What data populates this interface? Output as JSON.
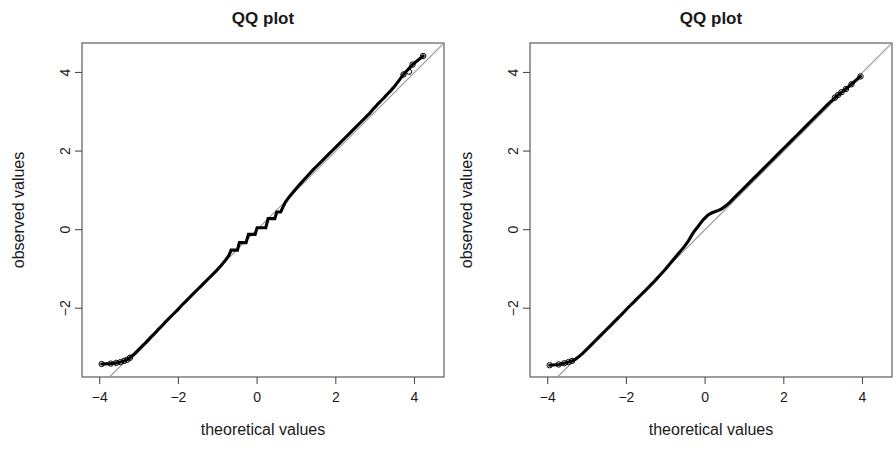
{
  "figure": {
    "width": 896,
    "height": 460,
    "background": "#ffffff",
    "panel_count": 2
  },
  "colors": {
    "point": "#000000",
    "reference_line": "#9a9a9a",
    "axis": "#4d4d4d",
    "text": "#1a1a1a",
    "background": "#ffffff"
  },
  "chart_data": [
    {
      "type": "scatter",
      "panel": "left",
      "title": "QQ plot",
      "xlabel": "theoretical values",
      "ylabel": "observed values",
      "xlim": [
        -4.45,
        4.75
      ],
      "ylim": [
        -3.75,
        4.75
      ],
      "xticks": [
        -4,
        -2,
        0,
        2,
        4
      ],
      "xticklabels": [
        "-4",
        "-2",
        "0",
        "2",
        "4"
      ],
      "yticks": [
        -2,
        0,
        2,
        4
      ],
      "yticklabels": [
        "-2",
        "0",
        "2",
        "4"
      ],
      "grid": false,
      "legend": null,
      "reference_line": {
        "slope": 1.0,
        "intercept": 0.0,
        "label": "identity line",
        "color": "#9a9a9a"
      },
      "notes": "Dense chain of points with a discrete staircase near the centre; upper tail points sit above the identity line.",
      "x": [
        -3.95,
        -3.72,
        -3.58,
        -3.47,
        -3.38,
        -3.3,
        -3.23,
        -3.17,
        -3.11,
        -3.06,
        -3.01,
        -2.96,
        -2.91,
        -2.86,
        -2.8,
        -2.72,
        -2.62,
        -2.52,
        -2.42,
        -2.32,
        -2.22,
        -2.12,
        -2.02,
        -1.92,
        -1.82,
        -1.72,
        -1.62,
        -1.52,
        -1.42,
        -1.32,
        -1.22,
        -1.12,
        -1.02,
        -0.92,
        -0.82,
        -0.72,
        -0.66,
        -0.6,
        -0.55,
        -0.5,
        -0.45,
        -0.4,
        -0.34,
        -0.28,
        -0.22,
        -0.16,
        -0.1,
        -0.05,
        0.0,
        0.05,
        0.1,
        0.16,
        0.22,
        0.28,
        0.34,
        0.4,
        0.45,
        0.5,
        0.55,
        0.6,
        0.66,
        0.72,
        0.82,
        0.92,
        1.02,
        1.12,
        1.22,
        1.32,
        1.42,
        1.52,
        1.62,
        1.72,
        1.82,
        1.92,
        2.02,
        2.12,
        2.22,
        2.32,
        2.42,
        2.52,
        2.62,
        2.72,
        2.8,
        2.86,
        2.91,
        2.96,
        3.01,
        3.06,
        3.11,
        3.17,
        3.23,
        3.3,
        3.38,
        3.47,
        3.58,
        3.72,
        3.95,
        4.22
      ],
      "y": [
        -3.42,
        -3.41,
        -3.39,
        -3.37,
        -3.34,
        -3.31,
        -3.26,
        -3.21,
        -3.16,
        -3.11,
        -3.06,
        -3.01,
        -2.96,
        -2.91,
        -2.85,
        -2.76,
        -2.66,
        -2.55,
        -2.45,
        -2.34,
        -2.24,
        -2.14,
        -2.04,
        -1.93,
        -1.83,
        -1.73,
        -1.63,
        -1.53,
        -1.43,
        -1.33,
        -1.23,
        -1.13,
        -1.03,
        -0.92,
        -0.8,
        -0.66,
        -0.52,
        -0.52,
        -0.52,
        -0.52,
        -0.33,
        -0.33,
        -0.33,
        -0.33,
        -0.12,
        -0.12,
        -0.12,
        -0.12,
        0.05,
        0.05,
        0.05,
        0.05,
        0.05,
        0.28,
        0.28,
        0.28,
        0.28,
        0.45,
        0.45,
        0.45,
        0.58,
        0.7,
        0.84,
        0.96,
        1.08,
        1.19,
        1.3,
        1.41,
        1.52,
        1.62,
        1.72,
        1.82,
        1.92,
        2.02,
        2.12,
        2.22,
        2.32,
        2.42,
        2.52,
        2.62,
        2.72,
        2.82,
        2.9,
        2.96,
        3.02,
        3.08,
        3.13,
        3.19,
        3.24,
        3.3,
        3.36,
        3.44,
        3.52,
        3.62,
        3.76,
        3.95,
        4.2,
        4.42
      ],
      "open_tail_points": {
        "lower": [
          [
            -3.95,
            -3.42
          ],
          [
            -3.72,
            -3.41
          ],
          [
            -3.58,
            -3.39
          ],
          [
            -3.47,
            -3.37
          ],
          [
            -3.38,
            -3.34
          ],
          [
            -3.3,
            -3.31
          ],
          [
            -3.23,
            -3.26
          ]
        ],
        "upper": [
          [
            3.72,
            3.95
          ],
          [
            3.95,
            4.2
          ],
          [
            3.86,
            4.02
          ],
          [
            4.22,
            4.42
          ]
        ]
      }
    },
    {
      "type": "scatter",
      "panel": "right",
      "title": "QQ plot",
      "xlabel": "theoretical values",
      "ylabel": "observed values",
      "xlim": [
        -4.45,
        4.75
      ],
      "ylim": [
        -3.75,
        4.75
      ],
      "xticks": [
        -4,
        -2,
        0,
        2,
        4
      ],
      "xticklabels": [
        "-4",
        "-2",
        "0",
        "2",
        "4"
      ],
      "yticks": [
        -2,
        0,
        2,
        4
      ],
      "yticklabels": [
        "-2",
        "0",
        "2",
        "4"
      ],
      "grid": false,
      "legend": null,
      "reference_line": {
        "slope": 1.0,
        "intercept": 0.0,
        "label": "identity line",
        "color": "#9a9a9a"
      },
      "notes": "Smoother chain of points with a single S-bend near the centre; tails track the identity line closely.",
      "x": [
        -3.95,
        -3.72,
        -3.58,
        -3.47,
        -3.38,
        -3.3,
        -3.23,
        -3.17,
        -3.11,
        -3.06,
        -3.01,
        -2.96,
        -2.91,
        -2.86,
        -2.8,
        -2.72,
        -2.62,
        -2.52,
        -2.42,
        -2.32,
        -2.22,
        -2.12,
        -2.02,
        -1.92,
        -1.82,
        -1.72,
        -1.62,
        -1.52,
        -1.42,
        -1.32,
        -1.22,
        -1.12,
        -1.02,
        -0.92,
        -0.82,
        -0.72,
        -0.62,
        -0.52,
        -0.42,
        -0.34,
        -0.26,
        -0.18,
        -0.12,
        -0.06,
        0.0,
        0.06,
        0.12,
        0.18,
        0.26,
        0.34,
        0.42,
        0.52,
        0.62,
        0.72,
        0.82,
        0.92,
        1.02,
        1.12,
        1.22,
        1.32,
        1.42,
        1.52,
        1.62,
        1.72,
        1.82,
        1.92,
        2.02,
        2.12,
        2.22,
        2.32,
        2.42,
        2.52,
        2.62,
        2.72,
        2.8,
        2.86,
        2.91,
        2.96,
        3.01,
        3.06,
        3.11,
        3.17,
        3.23,
        3.3,
        3.38,
        3.47,
        3.58,
        3.72,
        3.95
      ],
      "y": [
        -3.45,
        -3.43,
        -3.4,
        -3.37,
        -3.34,
        -3.3,
        -3.25,
        -3.2,
        -3.15,
        -3.1,
        -3.05,
        -3.0,
        -2.95,
        -2.9,
        -2.84,
        -2.76,
        -2.66,
        -2.56,
        -2.46,
        -2.36,
        -2.26,
        -2.16,
        -2.05,
        -1.95,
        -1.85,
        -1.75,
        -1.65,
        -1.55,
        -1.45,
        -1.35,
        -1.24,
        -1.13,
        -1.02,
        -0.9,
        -0.78,
        -0.66,
        -0.54,
        -0.42,
        -0.28,
        -0.14,
        -0.02,
        0.08,
        0.16,
        0.24,
        0.3,
        0.36,
        0.4,
        0.43,
        0.46,
        0.49,
        0.53,
        0.6,
        0.69,
        0.79,
        0.89,
        0.99,
        1.09,
        1.19,
        1.29,
        1.39,
        1.49,
        1.59,
        1.69,
        1.79,
        1.89,
        1.99,
        2.09,
        2.19,
        2.29,
        2.39,
        2.49,
        2.59,
        2.69,
        2.79,
        2.87,
        2.93,
        2.98,
        3.03,
        3.08,
        3.13,
        3.18,
        3.24,
        3.29,
        3.36,
        3.43,
        3.5,
        3.58,
        3.7,
        3.9
      ],
      "open_tail_points": {
        "lower": [
          [
            -3.95,
            -3.45
          ],
          [
            -3.72,
            -3.43
          ],
          [
            -3.58,
            -3.4
          ],
          [
            -3.47,
            -3.37
          ],
          [
            -3.38,
            -3.34
          ]
        ],
        "upper": [
          [
            3.3,
            3.36
          ],
          [
            3.38,
            3.43
          ],
          [
            3.47,
            3.5
          ],
          [
            3.58,
            3.58
          ],
          [
            3.72,
            3.7
          ],
          [
            3.95,
            3.9
          ]
        ]
      }
    }
  ]
}
